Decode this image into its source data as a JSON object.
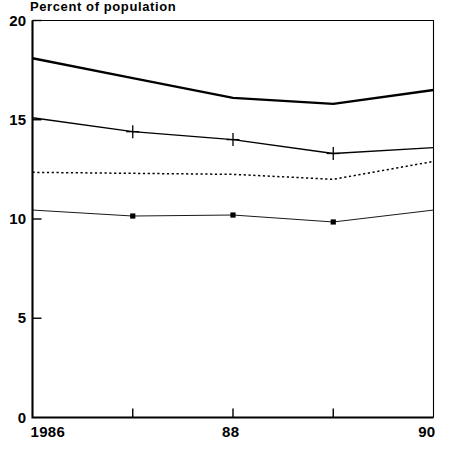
{
  "chart_data": {
    "type": "line",
    "title": "Percent of population",
    "xlabel": "",
    "ylabel": "",
    "xlim": [
      1986,
      1990
    ],
    "ylim": [
      0,
      20
    ],
    "grid": false,
    "legend": "none",
    "xticks": [
      {
        "value": 1986,
        "label": "1986"
      },
      {
        "value": 1987,
        "label": ""
      },
      {
        "value": 1988,
        "label": "88"
      },
      {
        "value": 1989,
        "label": ""
      },
      {
        "value": 1990,
        "label": "90"
      }
    ],
    "yticks": [
      {
        "value": 0,
        "label": "0"
      },
      {
        "value": 5,
        "label": "5"
      },
      {
        "value": 10,
        "label": "10"
      },
      {
        "value": 15,
        "label": "15"
      },
      {
        "value": 20,
        "label": "20"
      }
    ],
    "x": [
      1986,
      1987,
      1988,
      1989,
      1990
    ],
    "series": [
      {
        "name": "series-1-thick-solid",
        "style": "solid-thick",
        "marker": "none",
        "color": "#000000",
        "values": [
          18.1,
          17.1,
          16.1,
          15.8,
          16.5
        ]
      },
      {
        "name": "series-2-solid-plus",
        "style": "solid-thin",
        "marker": "plus",
        "color": "#000000",
        "values": [
          15.1,
          14.4,
          14.0,
          13.3,
          13.6
        ]
      },
      {
        "name": "series-3-dotted",
        "style": "dotted",
        "marker": "none",
        "color": "#000000",
        "values": [
          12.35,
          12.3,
          12.25,
          12.0,
          12.9
        ]
      },
      {
        "name": "series-4-thin-dot",
        "style": "solid-hairline",
        "marker": "square",
        "color": "#000000",
        "values": [
          10.45,
          10.15,
          10.2,
          9.85,
          10.45
        ]
      }
    ]
  }
}
